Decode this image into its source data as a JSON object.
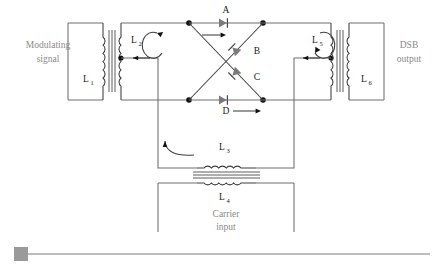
{
  "figure": {
    "background_color": "#ffffff",
    "wire_color": "#6e6e6e",
    "label_gray": "#8a8a8a",
    "label_dark": "#1a1a1a"
  },
  "labels": {
    "modulating_signal_line1": "Modulating",
    "modulating_signal_line2": "signal",
    "dsb_output_line1": "DSB",
    "dsb_output_line2": "output",
    "carrier_input_line1": "Carrier",
    "carrier_input_line2": "input"
  },
  "inductors": [
    {
      "id": "L1",
      "base": "L",
      "sub": "1"
    },
    {
      "id": "L2",
      "base": "L",
      "sub": "2"
    },
    {
      "id": "L3",
      "base": "L",
      "sub": "3"
    },
    {
      "id": "L4",
      "base": "L",
      "sub": "4"
    },
    {
      "id": "L5",
      "base": "L",
      "sub": "5"
    },
    {
      "id": "L6",
      "base": "L",
      "sub": "6"
    }
  ],
  "diodes": [
    {
      "id": "A",
      "label": "A",
      "position": "top",
      "direction": "right"
    },
    {
      "id": "B",
      "label": "B",
      "position": "diagonal-upper-right",
      "direction": "up-right"
    },
    {
      "id": "C",
      "label": "C",
      "position": "diagonal-lower-right",
      "direction": "up-left"
    },
    {
      "id": "D",
      "label": "D",
      "position": "bottom",
      "direction": "right"
    }
  ],
  "scrollbar": {
    "orientation": "horizontal",
    "handle_position": "left",
    "track_color": "#a6a6a6",
    "handle_color": "#9a9a9a"
  }
}
